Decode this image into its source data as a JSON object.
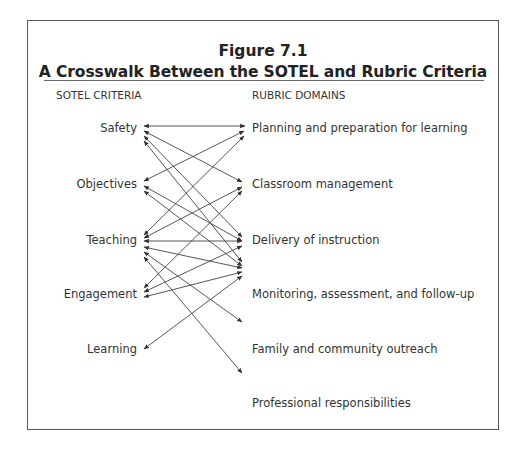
{
  "figure": {
    "number": "Figure 7.1",
    "title": "A Crosswalk Between the SOTEL and Rubric Criteria"
  },
  "columns": {
    "left_header": "SOTEL CRITERIA",
    "right_header": "RUBRIC DOMAINS"
  },
  "sotel_criteria": [
    {
      "label": "Safety"
    },
    {
      "label": "Objectives"
    },
    {
      "label": "Teaching"
    },
    {
      "label": "Engagement"
    },
    {
      "label": "Learning"
    }
  ],
  "rubric_domains": [
    {
      "label": "Planning and preparation for learning"
    },
    {
      "label": "Classroom management"
    },
    {
      "label": "Delivery of instruction"
    },
    {
      "label": "Monitoring, assessment, and follow-up"
    },
    {
      "label": "Family and community outreach"
    },
    {
      "label": "Professional responsibilities"
    }
  ],
  "connections": [
    {
      "from": "Safety",
      "to": "Planning and preparation for learning",
      "direction": "both"
    },
    {
      "from": "Safety",
      "to": "Classroom management",
      "direction": "both"
    },
    {
      "from": "Safety",
      "to": "Delivery of instruction",
      "direction": "both"
    },
    {
      "from": "Safety",
      "to": "Monitoring, assessment, and follow-up",
      "direction": "both"
    },
    {
      "from": "Objectives",
      "to": "Planning and preparation for learning",
      "direction": "both"
    },
    {
      "from": "Objectives",
      "to": "Delivery of instruction",
      "direction": "both"
    },
    {
      "from": "Objectives",
      "to": "Monitoring, assessment, and follow-up",
      "direction": "both"
    },
    {
      "from": "Teaching",
      "to": "Planning and preparation for learning",
      "direction": "both"
    },
    {
      "from": "Teaching",
      "to": "Classroom management",
      "direction": "both"
    },
    {
      "from": "Teaching",
      "to": "Delivery of instruction",
      "direction": "both"
    },
    {
      "from": "Teaching",
      "to": "Monitoring, assessment, and follow-up",
      "direction": "both"
    },
    {
      "from": "Teaching",
      "to": "Family and community outreach",
      "direction": "both"
    },
    {
      "from": "Teaching",
      "to": "Professional responsibilities",
      "direction": "both"
    },
    {
      "from": "Engagement",
      "to": "Classroom management",
      "direction": "both"
    },
    {
      "from": "Engagement",
      "to": "Delivery of instruction",
      "direction": "both"
    },
    {
      "from": "Engagement",
      "to": "Monitoring, assessment, and follow-up",
      "direction": "both"
    },
    {
      "from": "Learning",
      "to": "Monitoring, assessment, and follow-up",
      "direction": "both"
    }
  ],
  "colors": {
    "line": "#333333",
    "border": "#555555",
    "text": "#333333"
  }
}
